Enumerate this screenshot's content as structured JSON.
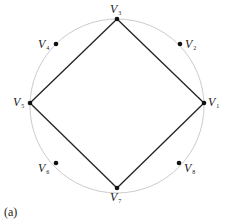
{
  "diagram": {
    "caption": "(a)",
    "circle": {
      "cx": 117,
      "cy": 106,
      "r": 87,
      "color": "#cccccc"
    },
    "edge_color": "#222222",
    "vertices": [
      {
        "id": "V1",
        "letter": "V",
        "sub": "1",
        "x": 204,
        "y": 103,
        "lx": 208,
        "ly": 106
      },
      {
        "id": "V2",
        "letter": "V",
        "sub": "2",
        "x": 180,
        "y": 44,
        "lx": 185,
        "ly": 48
      },
      {
        "id": "V3",
        "letter": "V",
        "sub": "3",
        "x": 117,
        "y": 19,
        "lx": 110,
        "ly": 13
      },
      {
        "id": "V4",
        "letter": "V",
        "sub": "4",
        "x": 56,
        "y": 44,
        "lx": 38,
        "ly": 48
      },
      {
        "id": "V5",
        "letter": "V",
        "sub": "5",
        "x": 30,
        "y": 103,
        "lx": 13,
        "ly": 106
      },
      {
        "id": "V6",
        "letter": "V",
        "sub": "6",
        "x": 56,
        "y": 163,
        "lx": 38,
        "ly": 172
      },
      {
        "id": "V7",
        "letter": "V",
        "sub": "7",
        "x": 117,
        "y": 188,
        "lx": 110,
        "ly": 201
      },
      {
        "id": "V8",
        "letter": "V",
        "sub": "8",
        "x": 179,
        "y": 163,
        "lx": 184,
        "ly": 172
      }
    ],
    "edges": [
      [
        "V3",
        "V1"
      ],
      [
        "V1",
        "V7"
      ],
      [
        "V7",
        "V5"
      ],
      [
        "V5",
        "V3"
      ]
    ]
  }
}
